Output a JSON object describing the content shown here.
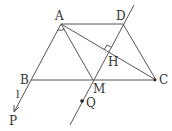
{
  "diagram": {
    "type": "geometry",
    "points": {
      "A": {
        "label": "A",
        "x": 61,
        "y": 24
      },
      "D": {
        "label": "D",
        "x": 123,
        "y": 24
      },
      "B": {
        "label": "B",
        "x": 31,
        "y": 80
      },
      "C": {
        "label": "C",
        "x": 156,
        "y": 80
      },
      "M": {
        "label": "M",
        "x": 93,
        "y": 80
      },
      "H": {
        "label": "H",
        "x": 108,
        "y": 52
      },
      "P": {
        "label": "P",
        "x": 14,
        "y": 112
      },
      "Q": {
        "label": "Q",
        "x": 83,
        "y": 102
      }
    },
    "line_label": "l",
    "segments": [
      "AD",
      "BC",
      "AB",
      "DC",
      "AC",
      "AM",
      "DM"
    ],
    "right_angle_at": "H",
    "colors": {
      "stroke": "#555555",
      "text": "#333333"
    }
  }
}
